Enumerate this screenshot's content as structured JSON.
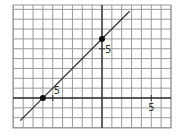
{
  "chart_data": {
    "type": "line",
    "title": "",
    "xlabel": "",
    "ylabel": "",
    "grid": true,
    "xlim": [
      -9,
      7
    ],
    "ylim": [
      -3,
      9
    ],
    "tick_labels": [
      {
        "axis": "x",
        "value": 5,
        "text": "5"
      },
      {
        "axis": "y",
        "value": 5,
        "text": "5"
      },
      {
        "axis": "x",
        "value": -5,
        "text": "5"
      }
    ],
    "series": [
      {
        "name": "line",
        "equation": "y = x + 6",
        "x": [
          -8.3,
          2.8
        ],
        "y": [
          -2.3,
          8.8
        ]
      }
    ],
    "points": [
      {
        "x": -6,
        "y": 0
      },
      {
        "x": 0,
        "y": 6
      }
    ]
  },
  "colors": {
    "grid": "#9a9a9a",
    "axis": "#333333",
    "line": "#333333",
    "point": "#111111"
  }
}
